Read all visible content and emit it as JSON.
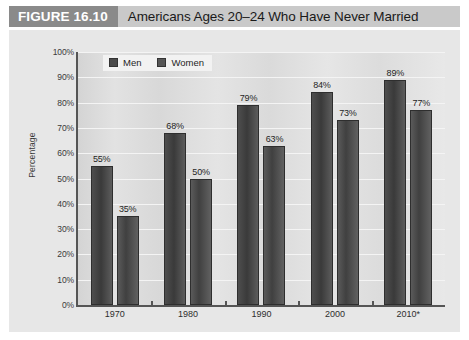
{
  "figure": {
    "tag": "FIGURE 16.10",
    "title": "Americans Ages 20–24 Who Have Never Married"
  },
  "legend": {
    "position": "top-left-inside-plot",
    "items": [
      {
        "label": "Men",
        "swatch": "dark-gray-square"
      },
      {
        "label": "Women",
        "swatch": "dark-gray-square"
      }
    ]
  },
  "axes": {
    "y_title": "Percentage",
    "y_ticks": [
      "100%",
      "90%",
      "80%",
      "70%",
      "60%",
      "50%",
      "40%",
      "30%",
      "20%",
      "10%",
      "0%"
    ],
    "x_ticks": [
      "1970",
      "1980",
      "1990",
      "2000",
      "2010*"
    ]
  },
  "chart_data": {
    "type": "bar",
    "title": "Americans Ages 20–24 Who Have Never Married",
    "xlabel": "",
    "ylabel": "Percentage",
    "ylim": [
      0,
      100
    ],
    "ytick_step": 10,
    "grid": true,
    "legend_position": "upper left",
    "categories": [
      "1970",
      "1980",
      "1990",
      "2000",
      "2010*"
    ],
    "series": [
      {
        "name": "Men",
        "values": [
          55,
          68,
          79,
          84,
          89
        ],
        "labels": [
          "55%",
          "68%",
          "79%",
          "84%",
          "89%"
        ],
        "color": "#3f3f3f"
      },
      {
        "name": "Women",
        "values": [
          35,
          50,
          63,
          73,
          77
        ],
        "labels": [
          "35%",
          "50%",
          "63%",
          "73%",
          "77%"
        ],
        "color": "#4d4d4d"
      }
    ]
  }
}
